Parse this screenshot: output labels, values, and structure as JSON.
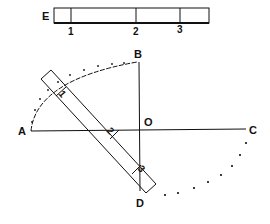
{
  "diagram": {
    "scale_bar": {
      "label": "E",
      "ticks": [
        "1",
        "2",
        "3"
      ]
    },
    "points": {
      "A": "A",
      "B": "B",
      "C": "C",
      "D": "D",
      "O": "O"
    },
    "rod_marks": [
      "1",
      "2",
      "3"
    ],
    "colors": {
      "ink": "#111111",
      "background": "#ffffff"
    }
  }
}
